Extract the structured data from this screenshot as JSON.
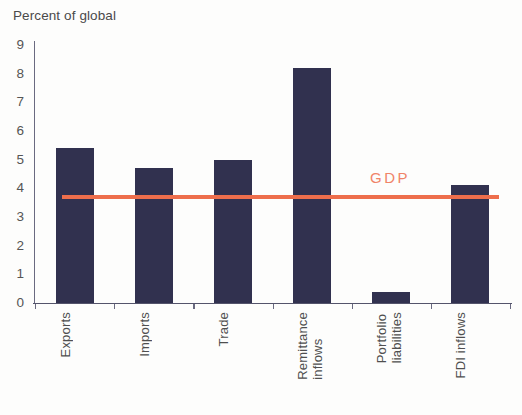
{
  "chart_data": {
    "type": "bar",
    "title": "Percent of global",
    "xlabel": "",
    "ylabel": "",
    "ylim": [
      0,
      9
    ],
    "yticks": [
      "9",
      "8",
      "7",
      "6",
      "5",
      "4",
      "3",
      "2",
      "1",
      "0"
    ],
    "grid": false,
    "legend": "none",
    "categories": [
      "Exports",
      "Imports",
      "Trade",
      "Remittance inflows",
      "Portfolio liabilities",
      "FDI inflows"
    ],
    "category_lines": [
      [
        "Exports"
      ],
      [
        "Imports"
      ],
      [
        "Trade"
      ],
      [
        "Remittance",
        "inflows"
      ],
      [
        "Portfolio",
        "liabilities"
      ],
      [
        "FDI inflows"
      ]
    ],
    "values": [
      5.4,
      4.7,
      5.0,
      8.2,
      0.4,
      4.1
    ],
    "series": [
      {
        "name": "Percent of global",
        "type": "bar",
        "values": [
          5.4,
          4.7,
          5.0,
          8.2,
          0.4,
          4.1
        ],
        "color": "#31314f"
      },
      {
        "name": "GDP",
        "type": "reference-line",
        "value": 3.7,
        "color": "#ee6e4c",
        "label": "GDP"
      }
    ],
    "annotations": [
      {
        "text": "GDP",
        "value": 3.7,
        "color": "#f08468"
      }
    ]
  },
  "colors": {
    "bar": "#31314f",
    "gdp_line": "#ee6e4c",
    "gdp_text": "#f08468",
    "axis": "#54546b",
    "text": "#4f4f4f",
    "background": "#fdfdfc"
  }
}
